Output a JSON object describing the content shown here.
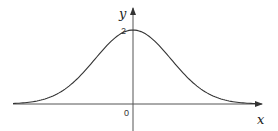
{
  "chart_data": {
    "type": "line",
    "title": "",
    "function": "bell curve (Gaussian), symmetric about the y-axis",
    "xlabel": "x",
    "ylabel": "y",
    "origin_label": "0",
    "peak": {
      "x": 0,
      "y": 2,
      "label": "2"
    },
    "series": [
      {
        "name": "curve",
        "mean": 0,
        "peak_value": 2
      }
    ],
    "grid": false,
    "legend": "none"
  },
  "colors": {
    "stroke": "#333333",
    "background": "#ffffff"
  }
}
